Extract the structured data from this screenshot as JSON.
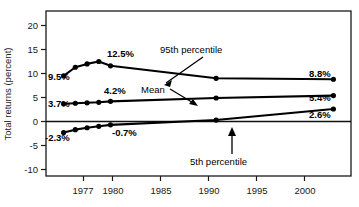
{
  "chart_data": {
    "type": "line",
    "title": "",
    "xlabel": "",
    "ylabel": "Total returns (percent)",
    "xlim": [
      1975.5,
      2001.5
    ],
    "ylim": [
      -10,
      22
    ],
    "grid": false,
    "legend": "inline-annotations",
    "xticks": [
      1977,
      1980,
      1985,
      1990,
      1995,
      2000
    ],
    "xticklabels": [
      "1977",
      "1980",
      "1985",
      "1990",
      "1995",
      "2000"
    ],
    "yticks": [
      -10,
      -5,
      0,
      5,
      10,
      15,
      20
    ],
    "yticklabels": [
      "-10",
      "-5",
      "0",
      "5",
      "10",
      "15",
      "20"
    ],
    "series": [
      {
        "name": "95th percentile",
        "x": [
          1977,
          1978,
          1979,
          1980,
          1981,
          1990,
          2000
        ],
        "values": [
          9.5,
          11.3,
          12.0,
          12.5,
          11.6,
          9.0,
          8.8
        ]
      },
      {
        "name": "Mean",
        "x": [
          1977,
          1978,
          1979,
          1980,
          1981,
          1990,
          2000
        ],
        "values": [
          3.7,
          3.8,
          3.9,
          4.0,
          4.2,
          4.9,
          5.4
        ]
      },
      {
        "name": "5th percentile",
        "x": [
          1977,
          1978,
          1979,
          1980,
          1981,
          1990,
          2000
        ],
        "values": [
          -2.3,
          -1.7,
          -1.3,
          -1.0,
          -0.7,
          0.3,
          2.6
        ]
      }
    ],
    "annotations": [
      {
        "name": "p95-start-label",
        "text": "9.5%"
      },
      {
        "name": "p95-peak-label",
        "text": "12.5%"
      },
      {
        "name": "p95-end-label",
        "text": "8.8%"
      },
      {
        "name": "mean-start-label",
        "text": "3.7%"
      },
      {
        "name": "mean-mid-label",
        "text": "4.2%"
      },
      {
        "name": "mean-end-label",
        "text": "5.4%"
      },
      {
        "name": "p5-start-label",
        "text": "-2.3%"
      },
      {
        "name": "p5-mid-label",
        "text": "-0.7%"
      },
      {
        "name": "p5-end-label",
        "text": "2.6%"
      },
      {
        "name": "p95-series-label",
        "text": "95th percentile"
      },
      {
        "name": "mean-series-label",
        "text": "Mean"
      },
      {
        "name": "p5-series-label",
        "text": "5th percentile"
      }
    ]
  },
  "labels": {
    "y_axis_title": "Total returns (percent)",
    "y_ticks": [
      "20",
      "15",
      "10",
      "5",
      "0",
      "-5",
      "-10"
    ],
    "x_ticks": [
      "1977",
      "1980",
      "1985",
      "1990",
      "1995",
      "2000"
    ],
    "p95_start": "9.5%",
    "p95_peak": "12.5%",
    "p95_end": "8.8%",
    "mean_start": "3.7%",
    "mean_mid": "4.2%",
    "mean_end": "5.4%",
    "p5_start": "-2.3%",
    "p5_mid": "-0.7%",
    "p5_end": "2.6%",
    "p95_name": "95th percentile",
    "mean_name": "Mean",
    "p5_name": "5th percentile"
  },
  "colors": {
    "line": "#000000",
    "text": "#1a1a1a",
    "background": "#ffffff"
  }
}
